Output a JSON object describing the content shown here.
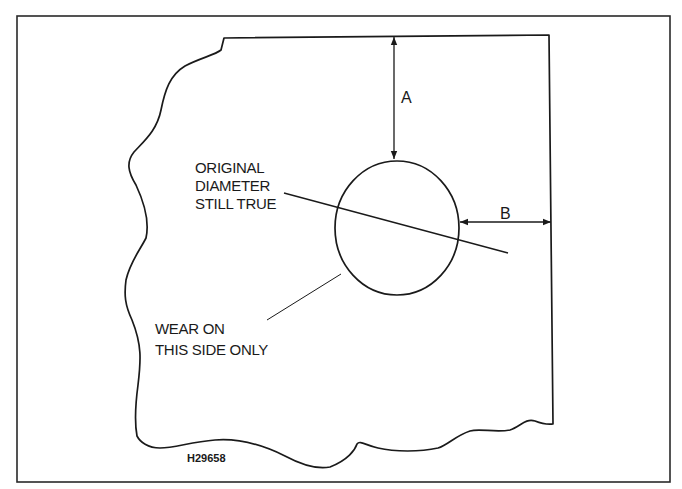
{
  "diagram": {
    "figure_id": "H29658",
    "dimensions": {
      "a_label": "A",
      "b_label": "B"
    },
    "callouts": {
      "original_diameter": [
        "ORIGINAL",
        "DIAMETER",
        "STILL TRUE"
      ],
      "wear_side": [
        "WEAR ON",
        "THIS SIDE ONLY"
      ]
    },
    "colors": {
      "line": "#1a1a1a",
      "background": "#ffffff"
    }
  }
}
